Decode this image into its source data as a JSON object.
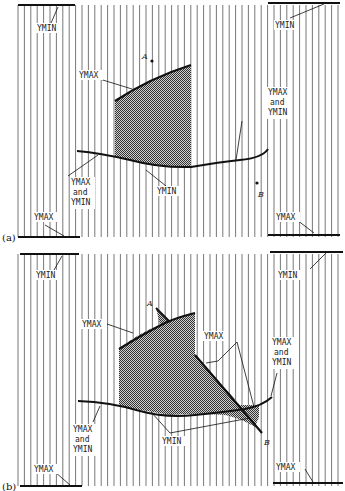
{
  "figure": {
    "colors": {
      "ink": "#111111",
      "hatch": "#555555",
      "fill": "#9a9a9a",
      "background": "#ffffff"
    },
    "panels": [
      {
        "id": "a",
        "panel_label": "(a)",
        "labels": {
          "left_top": "YMIN",
          "left_bottom": "YMAX",
          "right_top": "YMIN",
          "right_bottom": "YMAX",
          "upper_curve": "YMAX",
          "lower_curve": "YMIN",
          "left_both_1": "YMAX",
          "left_both_2": "and",
          "left_both_3": "YMIN",
          "right_both_1": "YMAX",
          "right_both_2": "and",
          "right_both_3": "YMIN",
          "point_a": "A",
          "point_b": "B"
        }
      },
      {
        "id": "b",
        "panel_label": "(b)",
        "labels": {
          "left_top": "YMIN",
          "left_bottom": "YMAX",
          "right_top": "YMIN",
          "right_bottom": "YMAX",
          "upper_curve": "YMAX",
          "diag_ymax": "YMAX",
          "lower_curve": "YMIN",
          "left_both_1": "YMAX",
          "left_both_2": "and",
          "left_both_3": "YMIN",
          "right_both_1": "YMAX",
          "right_both_2": "and",
          "right_both_3": "YMIN",
          "point_a": "A",
          "point_b": "B"
        }
      }
    ]
  }
}
